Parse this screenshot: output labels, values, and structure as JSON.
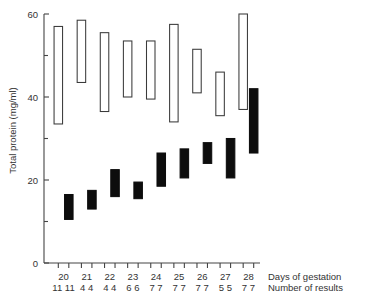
{
  "chart_data": {
    "type": "bar",
    "title": "",
    "subtitle": "",
    "xlabel": "Days of gestation",
    "ylabel": "Total protein (mg/ml)",
    "secondary_xlabel": "Number of results",
    "grid": false,
    "legend": "none",
    "ylim": [
      0,
      60
    ],
    "ytick_values": [
      0,
      20,
      40,
      60
    ],
    "ytick_labels": [
      "0",
      "20",
      "40",
      "60"
    ],
    "yminor_tick_values": [
      10,
      30,
      50
    ],
    "categories": [
      "20",
      "21",
      "22",
      "23",
      "24",
      "25",
      "26",
      "27",
      "28"
    ],
    "n_results_open": [
      "11",
      "4",
      "4",
      "6",
      "7",
      "7",
      "7",
      "5",
      "7"
    ],
    "n_results_filled": [
      "11",
      "4",
      "4",
      "6",
      "7",
      "7",
      "7",
      "5",
      "7"
    ],
    "n_results_display": [
      "11 11",
      "4 4",
      "4 4",
      "6 6",
      "7 7",
      "7 7",
      "7 7",
      "5 5",
      "7 7"
    ],
    "series": [
      {
        "name": "open",
        "style": "open-range-bar",
        "ranges": [
          {
            "category": "20",
            "low": 33.5,
            "high": 57.0
          },
          {
            "category": "21",
            "low": 43.5,
            "high": 58.5
          },
          {
            "category": "22",
            "low": 36.5,
            "high": 55.5
          },
          {
            "category": "23",
            "low": 40.0,
            "high": 53.5
          },
          {
            "category": "24",
            "low": 39.5,
            "high": 53.5
          },
          {
            "category": "25",
            "low": 34.0,
            "high": 57.5
          },
          {
            "category": "26",
            "low": 41.0,
            "high": 51.5
          },
          {
            "category": "27",
            "low": 35.5,
            "high": 46.0
          },
          {
            "category": "28",
            "low": 37.0,
            "high": 60.0
          }
        ]
      },
      {
        "name": "filled",
        "style": "filled-range-bar",
        "ranges": [
          {
            "category": "20",
            "low": 10.5,
            "high": 16.5
          },
          {
            "category": "21",
            "low": 13.0,
            "high": 17.5
          },
          {
            "category": "22",
            "low": 16.0,
            "high": 22.5
          },
          {
            "category": "23",
            "low": 15.5,
            "high": 19.5
          },
          {
            "category": "24",
            "low": 18.5,
            "high": 26.5
          },
          {
            "category": "25",
            "low": 20.5,
            "high": 27.5
          },
          {
            "category": "26",
            "low": 24.0,
            "high": 29.0
          },
          {
            "category": "27",
            "low": 20.5,
            "high": 30.0
          },
          {
            "category": "28",
            "low": 26.5,
            "high": 42.0
          }
        ]
      }
    ]
  }
}
